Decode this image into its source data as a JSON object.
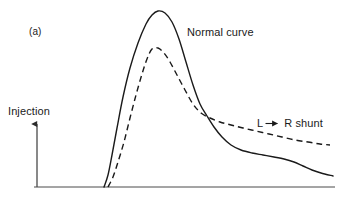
{
  "figure": {
    "panel_label": "(a)",
    "background_color": "#ffffff",
    "line_color": "#1a1a1a",
    "axis_color": "#3a3a3a",
    "width": 340,
    "height": 206
  },
  "axes": {
    "y_axis_label": "Injection",
    "y_axis_arrow_icon": "up-arrow-icon",
    "baseline_y": 187,
    "baseline_x_start": 34,
    "baseline_x_end": 335,
    "injection_arrow_x": 37,
    "injection_arrow_top": 121
  },
  "annotations": {
    "normal_curve_label": "Normal curve",
    "shunt_label_left": "L",
    "shunt_arrow_icon": "right-arrow-icon",
    "shunt_label_right": "R shunt"
  },
  "chart_data": {
    "type": "line",
    "title": "(a)",
    "xlabel": "",
    "ylabel": "Injection",
    "grid": false,
    "legend": "inline-annotations",
    "xlim": [
      34,
      335
    ],
    "ylim": [
      187,
      11
    ],
    "note": "Indicator dilution curves: normal curve (solid) versus left-to-right shunt curve (dashed). Coordinates are in pixel space with y measured downward; lower y = higher indicator concentration.",
    "series": [
      {
        "name": "Normal curve",
        "style": "solid",
        "color": "#1a1a1a",
        "peak": {
          "x": 158,
          "y": 11
        },
        "onset": {
          "x": 104,
          "y": 187
        },
        "end": {
          "x": 333,
          "y": 176
        },
        "points": [
          [
            104,
            187
          ],
          [
            108,
            175
          ],
          [
            112,
            155
          ],
          [
            117,
            128
          ],
          [
            123,
            97
          ],
          [
            130,
            68
          ],
          [
            138,
            43
          ],
          [
            146,
            24
          ],
          [
            152,
            15
          ],
          [
            158,
            11
          ],
          [
            165,
            13
          ],
          [
            172,
            22
          ],
          [
            179,
            39
          ],
          [
            186,
            62
          ],
          [
            193,
            85
          ],
          [
            200,
            104
          ],
          [
            207,
            116
          ],
          [
            214,
            127
          ],
          [
            222,
            137
          ],
          [
            231,
            145
          ],
          [
            241,
            150
          ],
          [
            252,
            153
          ],
          [
            263,
            155
          ],
          [
            274,
            157
          ],
          [
            284,
            159
          ],
          [
            294,
            162
          ],
          [
            303,
            166
          ],
          [
            312,
            170
          ],
          [
            321,
            173
          ],
          [
            333,
            176
          ]
        ]
      },
      {
        "name": "L → R shunt",
        "style": "dashed",
        "color": "#1a1a1a",
        "dash_pattern": [
          6,
          4
        ],
        "peak": {
          "x": 152,
          "y": 49
        },
        "onset": {
          "x": 108,
          "y": 187
        },
        "end": {
          "x": 330,
          "y": 145
        },
        "points": [
          [
            108,
            187
          ],
          [
            113,
            177
          ],
          [
            118,
            162
          ],
          [
            124,
            142
          ],
          [
            130,
            118
          ],
          [
            136,
            95
          ],
          [
            142,
            74
          ],
          [
            147,
            59
          ],
          [
            152,
            49
          ],
          [
            158,
            48
          ],
          [
            164,
            53
          ],
          [
            170,
            62
          ],
          [
            177,
            75
          ],
          [
            185,
            90
          ],
          [
            193,
            104
          ],
          [
            201,
            113
          ],
          [
            210,
            118
          ],
          [
            220,
            122
          ],
          [
            231,
            125
          ],
          [
            243,
            128
          ],
          [
            256,
            131
          ],
          [
            269,
            134
          ],
          [
            282,
            137
          ],
          [
            295,
            140
          ],
          [
            308,
            142
          ],
          [
            320,
            144
          ],
          [
            330,
            145
          ]
        ]
      }
    ],
    "crossing_point": {
      "x": 210,
      "y": 118
    }
  }
}
